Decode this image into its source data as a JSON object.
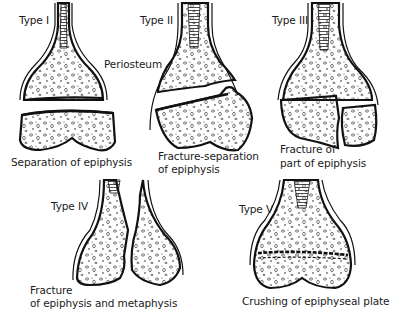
{
  "diagram": {
    "panels": [
      {
        "type_label": "Type I",
        "caption": [
          "Separation of epiphysis"
        ],
        "callout": "Periosteum"
      },
      {
        "type_label": "Type II",
        "caption": [
          "Fracture-separation",
          "of epiphysis"
        ]
      },
      {
        "type_label": "Type III",
        "caption": [
          "Fracture of",
          "part of epiphysis"
        ]
      },
      {
        "type_label": "Type IV",
        "caption": [
          "Fracture",
          "of epiphysis and metaphysis"
        ]
      },
      {
        "type_label": "Type V",
        "caption": [
          "Crushing of epiphyseal plate"
        ]
      }
    ],
    "colors": {
      "line": "#111111",
      "background": "#ffffff"
    }
  }
}
